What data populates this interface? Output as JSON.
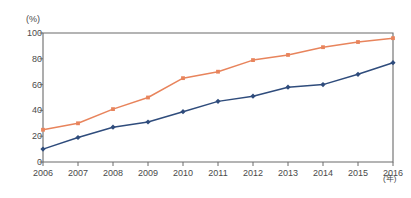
{
  "chart_data": {
    "type": "line",
    "title": "",
    "subtitle": "",
    "xlabel": "(年)",
    "ylabel": "(%)",
    "x": [
      2006,
      2007,
      2008,
      2009,
      2010,
      2011,
      2012,
      2013,
      2014,
      2015,
      2016
    ],
    "categories": [
      "2006",
      "2007",
      "2008",
      "2009",
      "2010",
      "2011",
      "2012",
      "2013",
      "2014",
      "2015",
      "2016"
    ],
    "xlim": [
      2006,
      2016
    ],
    "ylim": [
      0,
      100
    ],
    "y_ticks": [
      0,
      20,
      40,
      60,
      80,
      100
    ],
    "y_tick_labels": [
      "0",
      "20",
      "40",
      "60",
      "80",
      "100"
    ],
    "grid": false,
    "legend": "none",
    "series": [
      {
        "name": "orange-series",
        "color": "#E8845C",
        "marker": "square",
        "values": [
          25,
          30,
          41,
          50,
          65,
          70,
          79,
          83,
          89,
          93,
          96
        ]
      },
      {
        "name": "navy-series",
        "color": "#2F4C7C",
        "marker": "diamond",
        "values": [
          10,
          19,
          27,
          31,
          39,
          47,
          51,
          58,
          60,
          68,
          77
        ]
      }
    ]
  },
  "axes": {
    "y_unit_label": "(%)",
    "x_unit_label": "(年)"
  },
  "colors": {
    "frame": "#6b6b6b",
    "tick_text": "#4a4a4a",
    "series_orange": "#E8845C",
    "series_navy": "#2F4C7C",
    "background": "#ffffff"
  }
}
